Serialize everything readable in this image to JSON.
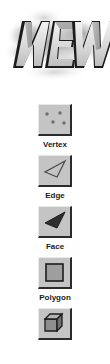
{
  "banner": {
    "name": "new-logo-banner",
    "text": "NEW",
    "style_description": "3D extruded grayscale letters over smoky cloud backdrop",
    "colors": {
      "letter_face": "#d9d9d9",
      "letter_shadow": "#1c1c1c",
      "letter_side": "#8c8c8c",
      "cloud": "#a8a8a8",
      "background": "#ffffff"
    }
  },
  "palette": {
    "name": "selection-mode-palette",
    "items": [
      {
        "id": "vertex",
        "label": "Vertex",
        "icon": "vertex-points-icon"
      },
      {
        "id": "edge",
        "label": "Edge",
        "icon": "edge-triangle-outline-icon"
      },
      {
        "id": "face",
        "label": "Face",
        "icon": "face-filled-triangle-icon"
      },
      {
        "id": "polygon",
        "label": "Polygon",
        "icon": "polygon-square-icon"
      },
      {
        "id": "object",
        "label": "",
        "icon": "object-cube-icon"
      }
    ]
  },
  "colors": {
    "button_face": "#c0c0c0",
    "button_highlight": "#e8e8e8",
    "button_shadow": "#2b2b2b",
    "icon_dark": "#3a3a3a",
    "icon_fill": "#9a9a9a",
    "text": "#1a1a1a",
    "page_background": "#ffffff"
  }
}
